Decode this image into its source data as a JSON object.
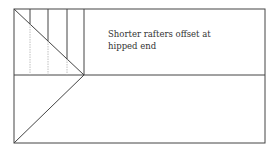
{
  "diagram": {
    "type": "roof-plan",
    "annotation": {
      "line1": "Shorter rafters offset at",
      "line2": "hipped end"
    },
    "colors": {
      "line": "#444444",
      "faint_line": "#b0b0b0",
      "text": "#333333",
      "background": "#ffffff"
    },
    "outline": {
      "x1": 14,
      "y1": 9,
      "x2": 265,
      "y2": 143
    },
    "ridge_y": 75,
    "hip_apex": {
      "x": 84,
      "y": 75
    },
    "rafter_x": [
      30,
      48,
      67,
      84
    ]
  }
}
